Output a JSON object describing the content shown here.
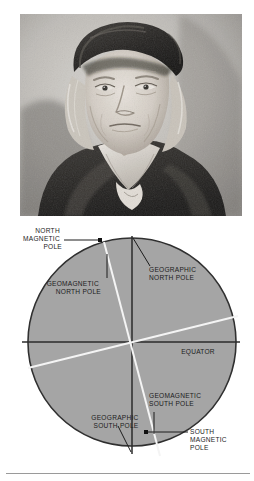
{
  "page": {
    "background_color": "#ffffff",
    "divider_color": "#9a9a9a"
  },
  "photo": {
    "alt": "Engraved portrait of an elderly man wearing a velvet cap",
    "description": "black and white engraving portrait",
    "frame_color": "#b9b7b2"
  },
  "diagram": {
    "globe_fill": "#a9a9a9",
    "globe_stroke": "#2b2b2b",
    "axis_color": "#2b2b2b",
    "magnetic_axis_color": "#f2f2f2",
    "marker_color": "#111111",
    "labels": {
      "north_magnetic_pole": [
        "NORTH",
        "MAGNETIC",
        "POLE"
      ],
      "geomagnetic_north_pole": [
        "GEOMAGNETIC",
        "NORTH POLE"
      ],
      "geographic_north_pole": [
        "GEOGRAPHIC",
        "NORTH POLE"
      ],
      "equator": [
        "EQUATOR"
      ],
      "geomagnetic_south_pole": [
        "GEOMAGNETIC",
        "SOUTH POLE"
      ],
      "geographic_south_pole": [
        "GEOGRAPHIC",
        "SOUTH POLE"
      ],
      "south_magnetic_pole": [
        "SOUTH",
        "MAGNETIC",
        "POLE"
      ]
    }
  }
}
